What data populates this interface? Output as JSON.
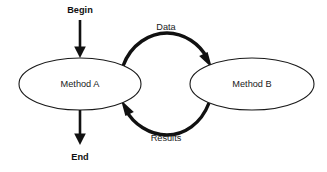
{
  "diagram": {
    "background_color": "#ffffff",
    "stroke_color": "#111111",
    "node_stroke_color": "#1a1a1a",
    "text_color": "#1a1a1a",
    "nodes": [
      {
        "id": "method-a",
        "label": "Method A",
        "shape": "ellipse",
        "cx": 80,
        "cy": 84,
        "rx": 61,
        "ry": 26
      },
      {
        "id": "method-b",
        "label": "Method B",
        "shape": "ellipse",
        "cx": 252,
        "cy": 84,
        "rx": 62,
        "ry": 26
      }
    ],
    "terminals": [
      {
        "id": "begin",
        "label": "Begin",
        "x": 80,
        "y": 11
      },
      {
        "id": "end",
        "label": "End",
        "x": 80,
        "y": 158
      }
    ],
    "edges": [
      {
        "id": "begin-to-method-a",
        "label": "",
        "from": "begin",
        "to": "method-a",
        "style": "straight-arrow",
        "direction": "down"
      },
      {
        "id": "data-arc",
        "label": "Data",
        "from": "method-a",
        "to": "method-b",
        "style": "curved-arrow",
        "direction": "clockwise-top",
        "label_x": 166,
        "label_y": 28
      },
      {
        "id": "results-arc",
        "label": "Results",
        "from": "method-b",
        "to": "method-a",
        "style": "curved-arrow",
        "direction": "clockwise-bottom",
        "label_x": 166,
        "label_y": 139
      },
      {
        "id": "method-a-to-end",
        "label": "",
        "from": "method-a",
        "to": "end",
        "style": "straight-arrow",
        "direction": "down"
      }
    ]
  }
}
